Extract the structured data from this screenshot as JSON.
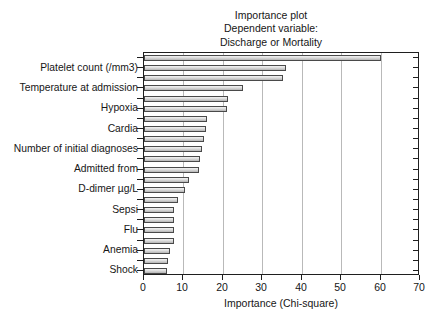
{
  "chart_data": {
    "type": "bar",
    "orientation": "horizontal",
    "title": "Importance plot",
    "subtitle_line1": "Dependent variable:",
    "subtitle_line2": "Discharge or Mortality",
    "title_lines": [
      "Importance plot",
      "Dependent variable:",
      "Discharge or Mortality"
    ],
    "xlabel": "Importance (Chi-square)",
    "ylabel": "",
    "xlim": [
      0,
      70
    ],
    "xticks": [
      0,
      10,
      20,
      30,
      40,
      50,
      60,
      70
    ],
    "xtick_labels": [
      "0",
      "10",
      "20",
      "30",
      "40",
      "50",
      "60",
      "70"
    ],
    "grid": "vertical",
    "legend": "none",
    "categories": [
      "",
      "Platelet count (/mm3)",
      "",
      "Temperature at admission",
      "",
      "Hypoxia",
      "",
      "Cardia",
      "",
      "Number of initial diagnoses",
      "",
      "Admitted from",
      "",
      "D-dimer µg/L",
      "",
      "Sepsi",
      "",
      "Flu",
      "",
      "Anemia",
      "",
      "Shock"
    ],
    "visible_category_labels": [
      "Platelet count (/mm3)",
      "Temperature at admission",
      "Hypoxia",
      "Cardia",
      "Number of initial diagnoses",
      "Admitted from",
      "D-dimer µg/L",
      "Sepsi",
      "Flu",
      "Anemia",
      "Shock"
    ],
    "values": [
      60.0,
      36.0,
      35.3,
      25.1,
      21.2,
      21.0,
      15.9,
      15.8,
      15.2,
      14.6,
      14.2,
      13.9,
      11.5,
      10.3,
      8.6,
      7.7,
      7.6,
      7.5,
      7.5,
      6.7,
      6.2,
      5.8
    ]
  },
  "axis": {
    "x_title": "Importance (Chi-square)"
  }
}
